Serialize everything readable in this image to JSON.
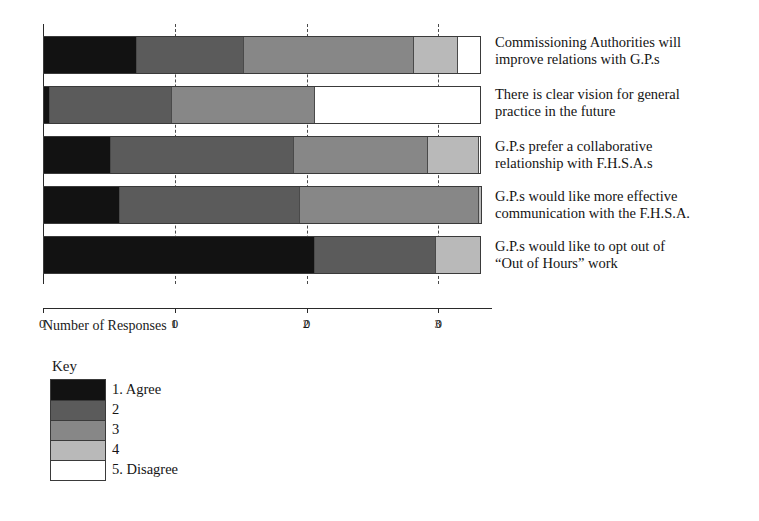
{
  "chart_data": {
    "type": "bar",
    "orientation": "horizontal",
    "stacked": true,
    "title": "",
    "xlabel": "Number of Responses",
    "ylabel": "",
    "xlim": [
      0,
      33
    ],
    "xticks": [
      0,
      10,
      20,
      30
    ],
    "xtick_labels": [
      "0",
      "10",
      "20",
      "30"
    ],
    "grid": true,
    "grid_style": "dashed vertical at ticks",
    "legend_title": "Key",
    "legend_position": "below-left",
    "categories": [
      "Commissioning Authorities will improve relations with G.P.s",
      "There is clear vision for general practice in the future",
      "G.P.s prefer a collaborative relationship with F.H.S.A.s",
      "G.P.s would like more effective communication with the F.H.S.A.",
      "G.P.s would like to opt out of “Out of Hours” work"
    ],
    "category_lines": [
      [
        "Commissioning Authorities will",
        "improve relations with G.P.s"
      ],
      [
        "There is clear vision for general",
        "practice in the future"
      ],
      [
        "G.P.s prefer a collaborative",
        "relationship with F.H.S.A.s"
      ],
      [
        "G.P.s would like more effective",
        "communication with the F.H.S.A."
      ],
      [
        "G.P.s would like to opt out of",
        "“Out of Hours” work"
      ]
    ],
    "series": [
      {
        "name": "1. Agree",
        "color": "#121212",
        "values": [
          7.0,
          0.4,
          5.0,
          5.7,
          20.6
        ]
      },
      {
        "name": "2",
        "color": "#5b5b5b",
        "values": [
          8.2,
          9.3,
          14.0,
          13.7,
          9.2
        ]
      },
      {
        "name": "3",
        "color": "#878787",
        "values": [
          12.9,
          10.9,
          10.2,
          13.7,
          0.0
        ]
      },
      {
        "name": "4",
        "color": "#b9b9b9",
        "values": [
          3.4,
          0.0,
          3.9,
          0.2,
          3.4
        ]
      },
      {
        "name": "5. Disagree",
        "color": "#ffffff",
        "values": [
          1.7,
          12.6,
          0.1,
          0.0,
          0.0
        ]
      }
    ],
    "bar_totals": [
      33.2,
      33.2,
      33.2,
      33.3,
      33.2
    ]
  },
  "legend": {
    "title": "Key",
    "entries": [
      {
        "label": "1. Agree",
        "color": "#121212"
      },
      {
        "label": "2",
        "color": "#5b5b5b"
      },
      {
        "label": "3",
        "color": "#878787"
      },
      {
        "label": "4",
        "color": "#b9b9b9"
      },
      {
        "label": "5. Disagree",
        "color": "#ffffff"
      }
    ]
  },
  "axis": {
    "x_title": "Number of Responses",
    "tick_labels": [
      "0",
      "10",
      "20",
      "30"
    ]
  }
}
